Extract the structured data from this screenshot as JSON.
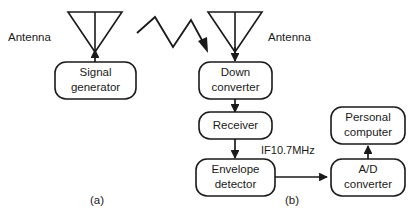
{
  "figure": {
    "caption_a": "(a)",
    "caption_b": "(b)"
  },
  "left_panel": {
    "antenna_label": "Antenna",
    "antenna_icon": "antenna-triangle-icon",
    "blocks": [
      {
        "id": "signal-generator",
        "line1": "Signal",
        "line2": "generator"
      }
    ]
  },
  "propagation": {
    "icon": "zigzag-wave-arrow-icon"
  },
  "right_panel": {
    "antenna_label": "Antenna",
    "antenna_icon": "antenna-triangle-icon",
    "signal_label": "IF10.7MHz",
    "blocks": [
      {
        "id": "down-converter",
        "line1": "Down",
        "line2": "converter"
      },
      {
        "id": "receiver",
        "line1": "Receiver",
        "line2": ""
      },
      {
        "id": "envelope-detector",
        "line1": "Envelope",
        "line2": "detector"
      },
      {
        "id": "ad-converter",
        "line1": "A/D",
        "line2": "converter"
      },
      {
        "id": "personal-computer",
        "line1": "Personal",
        "line2": "computer"
      }
    ]
  },
  "colors": {
    "ink": "#1a1a1a",
    "background": "#ffffff"
  }
}
